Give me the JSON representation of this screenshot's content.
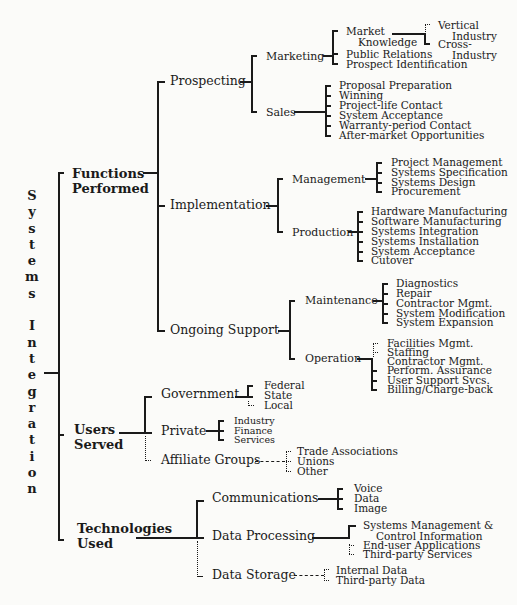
{
  "root": {
    "title_letters": [
      "S",
      "y",
      "s",
      "t",
      "e",
      "m",
      "s",
      " ",
      "I",
      "n",
      "t",
      "e",
      "g",
      "r",
      "a",
      "t",
      "i",
      "o",
      "n"
    ],
    "title": "Systems Integration"
  },
  "functions": {
    "label_line1": "Functions",
    "label_line2": "Performed",
    "prospecting": {
      "label": "Prospecting",
      "marketing": {
        "label": "Marketing",
        "market_knowledge_line1": "Market",
        "market_knowledge_line2": "Knowledge",
        "vertical_line1": "Vertical",
        "vertical_line2": "Industry",
        "cross_line1": "Cross-",
        "cross_line2": "Industry",
        "public_relations": "Public Relations",
        "prospect_identification": "Prospect Identification"
      },
      "sales": {
        "label": "Sales",
        "items": [
          "Proposal Preparation",
          "Winning",
          "Project-life Contact",
          "System Acceptance",
          "Warranty-period Contact",
          "After-market Opportunities"
        ]
      }
    },
    "implementation": {
      "label": "Implementation",
      "management": {
        "label": "Management",
        "items": [
          "Project Management",
          "Systems Specification",
          "Systems Design",
          "Procurement"
        ]
      },
      "production": {
        "label": "Production",
        "items": [
          "Hardware Manufacturing",
          "Software Manufacturing",
          "Systems Integration",
          "Systems Installation",
          "System Acceptance",
          "Cutover"
        ]
      }
    },
    "ongoing_support": {
      "label": "Ongoing Support",
      "maintenance": {
        "label": "Maintenance",
        "items": [
          "Diagnostics",
          "Repair",
          "Contractor Mgmt.",
          "System Modification",
          "System Expansion"
        ]
      },
      "operation": {
        "label": "Operation",
        "items": [
          "Facilities Mgmt.",
          "Staffing",
          "Contractor Mgmt.",
          "Perform. Assurance",
          "User Support Svcs.",
          "Billing/Charge-back"
        ]
      }
    }
  },
  "users": {
    "label_line1": "Users",
    "label_line2": "Served",
    "government": {
      "label": "Government",
      "items": [
        "Federal",
        "State",
        "Local"
      ]
    },
    "private": {
      "label": "Private",
      "items": [
        "Industry",
        "Finance",
        "Services"
      ]
    },
    "affiliate": {
      "label": "Affiliate Groups",
      "items": [
        "Trade Associations",
        "Unions",
        "Other"
      ]
    }
  },
  "technologies": {
    "label_line1": "Technologies",
    "label_line2": "Used",
    "communications": {
      "label": "Communications",
      "items": [
        "Voice",
        "Data",
        "Image"
      ]
    },
    "data_processing": {
      "label": "Data Processing",
      "smci_line1": "Systems Management &",
      "smci_line2": "Control Information",
      "items": [
        "End-user Applications",
        "Third-party Services"
      ]
    },
    "data_storage": {
      "label": "Data Storage",
      "items": [
        "Internal Data",
        "Third-party Data"
      ]
    }
  }
}
